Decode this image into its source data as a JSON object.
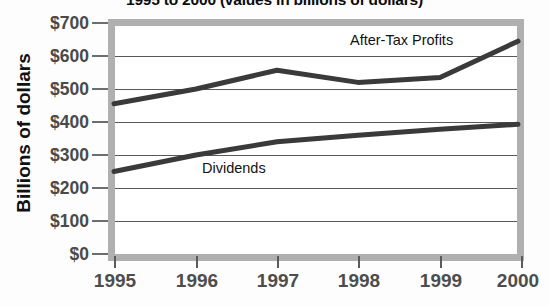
{
  "chart_data": {
    "type": "line",
    "title": "1995 to 2000 (values in billions of dollars)",
    "xlabel": "",
    "ylabel": "Billions of dollars",
    "categories": [
      "1995",
      "1996",
      "1997",
      "1998",
      "1999",
      "2000"
    ],
    "x": [
      1995,
      1996,
      1997,
      1998,
      1999,
      2000
    ],
    "ylim": [
      0,
      700
    ],
    "ytick_labels": [
      "$700",
      "$600",
      "$500",
      "$400",
      "$300",
      "$200",
      "$100",
      "$0"
    ],
    "ytick_values": [
      700,
      600,
      500,
      400,
      300,
      200,
      100,
      0
    ],
    "grid": true,
    "legend_position": "inline-annotations",
    "series": [
      {
        "name": "After-Tax Profits",
        "values": [
          455,
          500,
          557,
          520,
          535,
          645
        ],
        "color": "#3a3a3a"
      },
      {
        "name": "Dividends",
        "values": [
          250,
          300,
          340,
          360,
          378,
          393
        ],
        "color": "#3a3a3a"
      }
    ],
    "annotations": [
      {
        "text": "After-Tax Profits",
        "series": "After-Tax Profits"
      },
      {
        "text": "Dividends",
        "series": "Dividends"
      }
    ]
  },
  "colors": {
    "line": "#3a3a3a",
    "gridline": "#585858",
    "frame": "#b0b0b0",
    "tick_label": "#4d4d4d",
    "axis_title": "#111111",
    "plot_background": "#ffffff"
  }
}
